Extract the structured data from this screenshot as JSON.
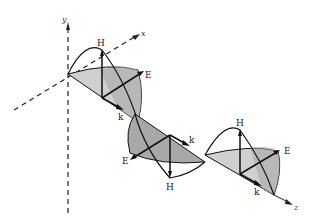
{
  "diagram": {
    "axes": {
      "x": "x",
      "y": "y",
      "z": "z"
    },
    "vectors": {
      "electric": "E",
      "magnetic": "H",
      "propagation": "k"
    },
    "labels": {
      "H1": "H",
      "E1": "E",
      "k1": "k",
      "k2": "k",
      "E2": "E",
      "H2": "H",
      "H3": "H",
      "E3": "E",
      "k3": "k",
      "k4": "k"
    },
    "colors": {
      "light_fill": "#d0d0d0",
      "dark_fill": "#a8a8a8",
      "line": "#111111"
    }
  }
}
